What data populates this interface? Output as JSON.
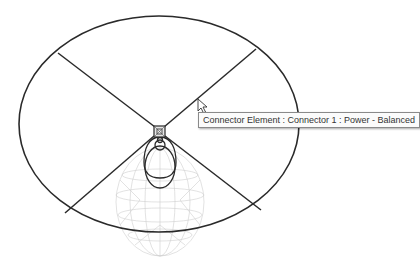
{
  "view": {
    "type": "revit-family-editor-3d-view",
    "element": "lighting-fixture-family"
  },
  "tooltip": {
    "text": "Connector Element : Connector 1 : Power - Balanced"
  },
  "colors": {
    "linework": "#2a2a2a",
    "wireframe": "#c8c8c8",
    "tooltip_bg": "#fbfbfb",
    "tooltip_border": "#8a8a8a"
  }
}
